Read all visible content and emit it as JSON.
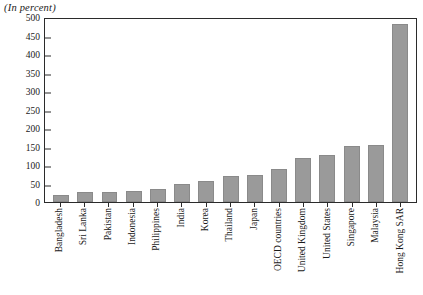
{
  "subtitle": "(In percent)",
  "chart_data": {
    "type": "bar",
    "title": "",
    "subtitle": "(In percent)",
    "xlabel": "",
    "ylabel": "",
    "ylim": [
      0,
      500
    ],
    "ytick_step": 50,
    "yticks": [
      0,
      50,
      100,
      150,
      200,
      250,
      300,
      350,
      400,
      450,
      500
    ],
    "grid": false,
    "legend": null,
    "bar_color": "#9a9a9a",
    "axis_color": "#2b2b2b",
    "categories": [
      "Bangladesh",
      "Sri Lanka",
      "Pakistan",
      "Indonesia",
      "Philippines",
      "India",
      "Korea",
      "Thailand",
      "Japan",
      "OECD countries",
      "United Kingdom",
      "United States",
      "Singapore",
      "Malaysia",
      "Hong Kong SAR"
    ],
    "values": [
      18,
      26,
      28,
      30,
      35,
      48,
      57,
      70,
      74,
      88,
      120,
      128,
      152,
      153,
      480
    ]
  }
}
